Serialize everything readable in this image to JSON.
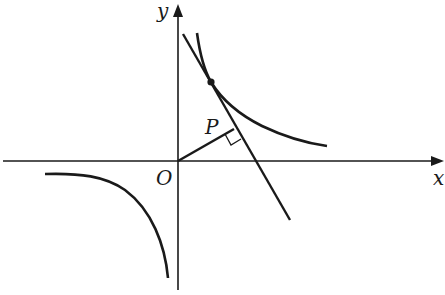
{
  "diagram": {
    "labels": {
      "x_axis": "x",
      "y_axis": "y",
      "origin": "O",
      "foot_point": "P"
    },
    "colors": {
      "stroke": "#1a1a1a",
      "background": "#ffffff"
    }
  }
}
